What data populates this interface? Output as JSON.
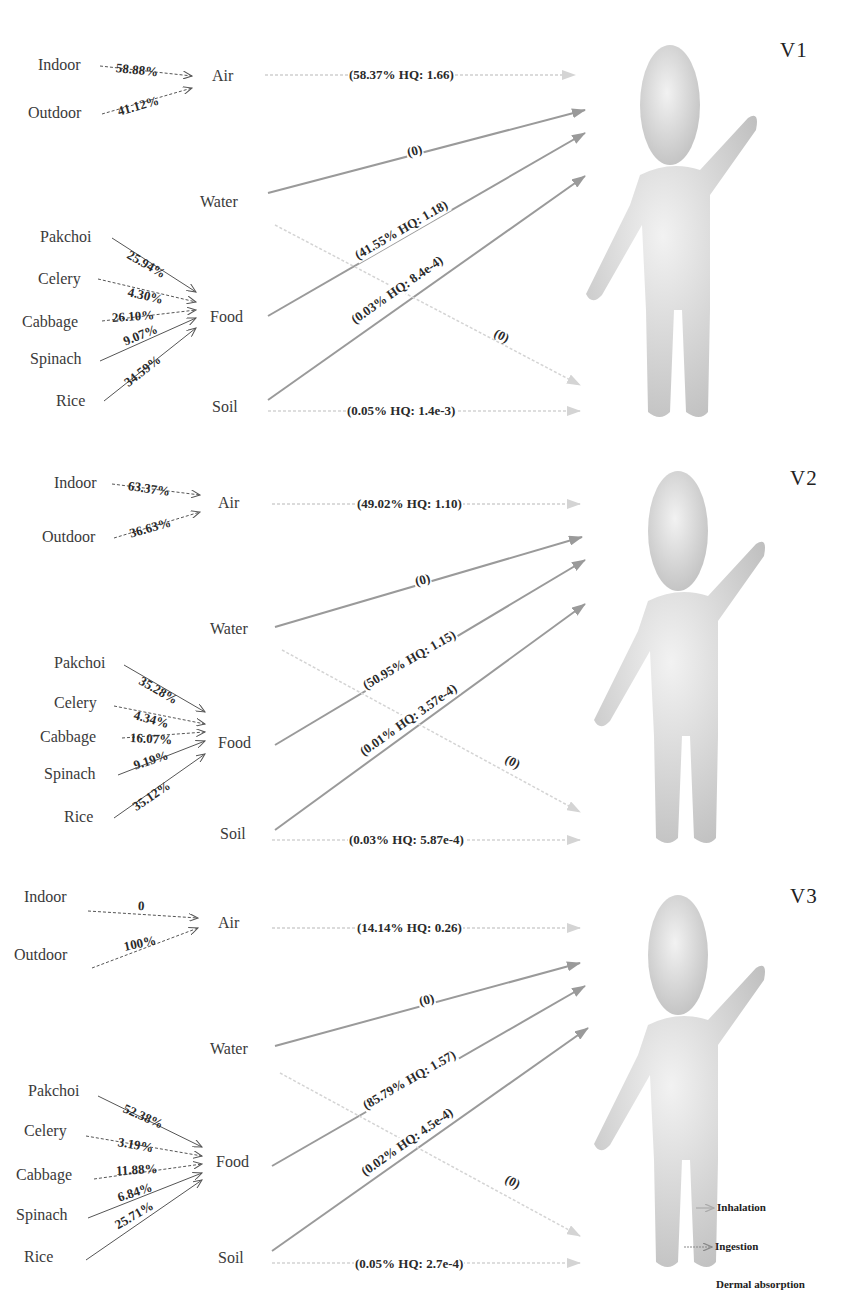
{
  "colors": {
    "strong_arrow": "#9a9a9a",
    "faint_arrow": "#cfcfcf",
    "source_arrow": "#555555",
    "text": "#333333",
    "figure": "#d9d9d9"
  },
  "nodes": {
    "air": "Air",
    "water": "Water",
    "food": "Food",
    "soil": "Soil"
  },
  "air_sources": [
    "Indoor",
    "Outdoor"
  ],
  "food_sources": [
    "Pakchoi",
    "Celery",
    "Cabbage",
    "Spinach",
    "Rice"
  ],
  "panels": [
    {
      "label": "V1",
      "air_sources": [
        {
          "name": "Indoor",
          "pct": "58.88%"
        },
        {
          "name": "Outdoor",
          "pct": "41.12%"
        }
      ],
      "food_sources": [
        {
          "name": "Pakchoi",
          "pct": "25.94%"
        },
        {
          "name": "Celery",
          "pct": "4.30%"
        },
        {
          "name": "Cabbage",
          "pct": "26.10%"
        },
        {
          "name": "Spinach",
          "pct": "9.07%"
        },
        {
          "name": "Rice",
          "pct": "34.59%"
        }
      ],
      "pathways": {
        "air_inhalation": "(58.37%  HQ: 1.66)",
        "water_ingestion": "(0)",
        "food_ingestion": "(41.55%  HQ: 1.18)",
        "soil_ingestion": "(0.03%  HQ: 8.4e-4)",
        "water_dermal": "(0)",
        "soil_dermal": "(0.05%  HQ: 1.4e-3)"
      }
    },
    {
      "label": "V2",
      "air_sources": [
        {
          "name": "Indoor",
          "pct": "63.37%"
        },
        {
          "name": "Outdoor",
          "pct": "36.63%"
        }
      ],
      "food_sources": [
        {
          "name": "Pakchoi",
          "pct": "35.28%"
        },
        {
          "name": "Celery",
          "pct": "4.34%"
        },
        {
          "name": "Cabbage",
          "pct": "16.07%"
        },
        {
          "name": "Spinach",
          "pct": "9.19%"
        },
        {
          "name": "Rice",
          "pct": "35.12%"
        }
      ],
      "pathways": {
        "air_inhalation": "(49.02%  HQ: 1.10)",
        "water_ingestion": "(0)",
        "food_ingestion": "(50.95%  HQ: 1.15)",
        "soil_ingestion": "(0.01%  HQ: 3.57e-4)",
        "water_dermal": "(0)",
        "soil_dermal": "(0.03%  HQ: 5.87e-4)"
      }
    },
    {
      "label": "V3",
      "air_sources": [
        {
          "name": "Indoor",
          "pct": "0"
        },
        {
          "name": "Outdoor",
          "pct": "100%"
        }
      ],
      "food_sources": [
        {
          "name": "Pakchoi",
          "pct": "52.38%"
        },
        {
          "name": "Celery",
          "pct": "3.19%"
        },
        {
          "name": "Cabbage",
          "pct": "11.88%"
        },
        {
          "name": "Spinach",
          "pct": "6.84%"
        },
        {
          "name": "Rice",
          "pct": "25.71%"
        }
      ],
      "pathways": {
        "air_inhalation": "(14.14%  HQ: 0.26)",
        "water_ingestion": "(0)",
        "food_ingestion": "(85.79%  HQ: 1.57)",
        "soil_ingestion": "(0.02%  HQ: 4.5e-4)",
        "water_dermal": "(0)",
        "soil_dermal": "(0.05%  HQ: 2.7e-4)"
      }
    }
  ],
  "legend": {
    "items": [
      {
        "label": "Inhalation",
        "style": "dotted-light"
      },
      {
        "label": "Ingestion",
        "style": "solid-dark"
      },
      {
        "label": "Dermal absorption",
        "style": "none"
      }
    ]
  }
}
